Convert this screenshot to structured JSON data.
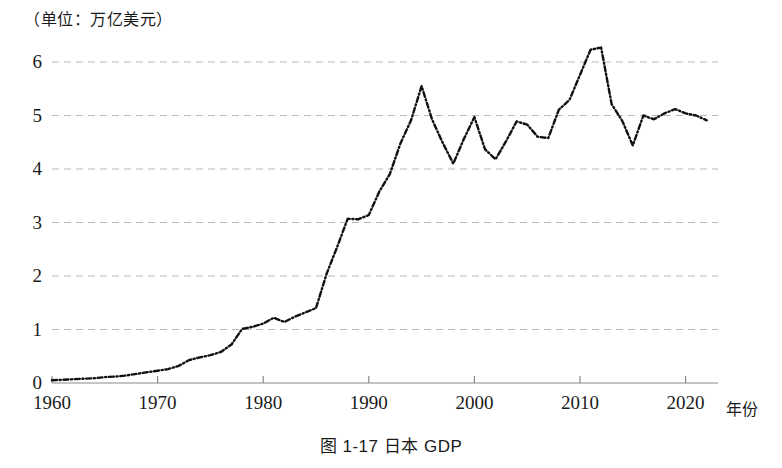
{
  "figure": {
    "unit_label": "（单位：万亿美元）",
    "caption": "图 1-17   日本 GDP",
    "x_axis_name": "年份"
  },
  "chart_data": {
    "type": "line",
    "title": "日本 GDP",
    "subtitle": "（单位：万亿美元）",
    "xlabel": "年份",
    "ylabel": "万亿美元",
    "xlim": [
      1960,
      2022
    ],
    "ylim": [
      0,
      6.5
    ],
    "yticks": [
      0,
      1,
      2,
      3,
      4,
      5,
      6
    ],
    "xticks": [
      1960,
      1970,
      1980,
      1990,
      2000,
      2010,
      2020
    ],
    "grid": "horizontal-dashed",
    "legend": "none",
    "line_style": "dash-dot",
    "line_color": "#111111",
    "grid_color": "#b8b8b8",
    "axis_color": "#8a8a8a",
    "x": [
      1960,
      1961,
      1962,
      1963,
      1964,
      1965,
      1966,
      1967,
      1968,
      1969,
      1970,
      1971,
      1972,
      1973,
      1974,
      1975,
      1976,
      1977,
      1978,
      1979,
      1980,
      1981,
      1982,
      1983,
      1984,
      1985,
      1986,
      1987,
      1988,
      1989,
      1990,
      1991,
      1992,
      1993,
      1994,
      1995,
      1996,
      1997,
      1998,
      1999,
      2000,
      2001,
      2002,
      2003,
      2004,
      2005,
      2006,
      2007,
      2008,
      2009,
      2010,
      2011,
      2012,
      2013,
      2014,
      2015,
      2016,
      2017,
      2018,
      2019,
      2020,
      2021,
      2022
    ],
    "values": [
      0.05,
      0.06,
      0.07,
      0.08,
      0.09,
      0.11,
      0.12,
      0.14,
      0.17,
      0.2,
      0.23,
      0.26,
      0.32,
      0.43,
      0.48,
      0.52,
      0.58,
      0.72,
      1.01,
      1.05,
      1.11,
      1.22,
      1.14,
      1.24,
      1.32,
      1.4,
      2.04,
      2.54,
      3.07,
      3.06,
      3.14,
      3.58,
      3.91,
      4.48,
      4.91,
      5.55,
      4.92,
      4.49,
      4.1,
      4.56,
      4.97,
      4.37,
      4.18,
      4.52,
      4.89,
      4.83,
      4.6,
      4.58,
      5.11,
      5.29,
      5.76,
      6.23,
      6.27,
      5.21,
      4.9,
      4.44,
      5.0,
      4.93,
      5.04,
      5.12,
      5.04,
      5.0,
      4.91
    ]
  }
}
